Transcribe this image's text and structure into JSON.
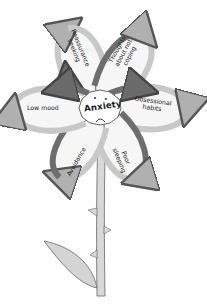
{
  "diagram": {
    "title": "Anxiety",
    "center": {
      "label": "Anxiety",
      "face": "sad-face"
    },
    "petals": [
      {
        "label_lines": [
          "Reassurance",
          "seeking"
        ],
        "position": "upper-left"
      },
      {
        "label_lines": [
          "Thoughts",
          "about not",
          "coping"
        ],
        "position": "upper-right"
      },
      {
        "label_lines": [
          "Obsessional",
          "habits"
        ],
        "position": "right"
      },
      {
        "label_lines": [
          "Poor",
          "sleeping"
        ],
        "position": "lower-right"
      },
      {
        "label_lines": [
          "Avoidance"
        ],
        "position": "lower-left"
      },
      {
        "label_lines": [
          "Low mood"
        ],
        "position": "left"
      }
    ],
    "colors": {
      "outline": "#555555",
      "petal_fill": "#f6f6f6",
      "arrow_light": "#c8c8c8",
      "arrow_dark": "#6e6e6e",
      "stem_fill": "#d8d8d8",
      "leaf_fill": "#d4d4d4"
    }
  }
}
